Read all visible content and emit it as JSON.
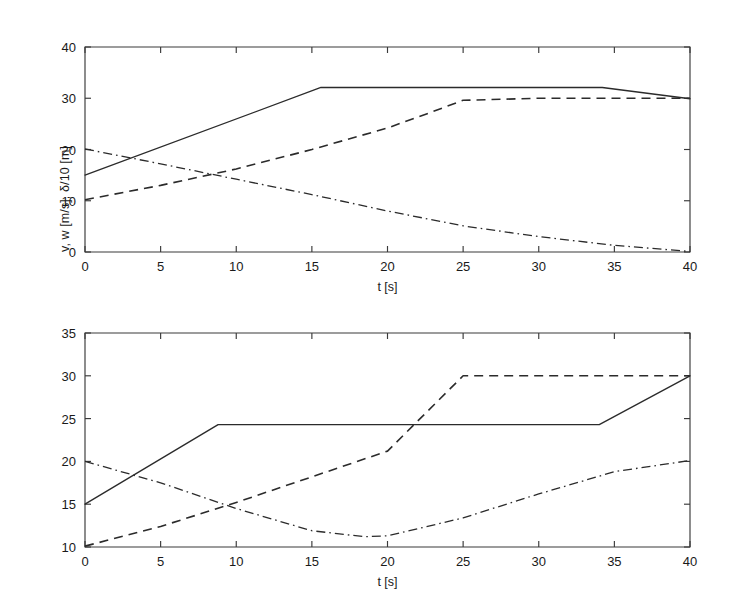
{
  "figure": {
    "background": "#ffffff",
    "ink_color": "#2b2b2b"
  },
  "chart_data": [
    {
      "id": "top",
      "type": "line",
      "title": "",
      "xlabel": "t [s]",
      "ylabel": "v, w [m/s], δ/10 [m]",
      "xlim": [
        0,
        40
      ],
      "ylim": [
        0,
        40
      ],
      "xticks": [
        0,
        5,
        10,
        15,
        20,
        25,
        30,
        35,
        40
      ],
      "xticklabels": [
        "0",
        "5",
        "10",
        "15",
        "20",
        "25",
        "30",
        "35",
        "40"
      ],
      "yticks": [
        0,
        10,
        20,
        30,
        40
      ],
      "yticklabels": [
        "0",
        "10",
        "20",
        "30",
        "40"
      ],
      "grid": false,
      "legend": "none",
      "series": [
        {
          "name": "v",
          "style": "solid",
          "x": [
            0,
            15.6,
            34.2,
            40
          ],
          "values": [
            15.0,
            32.1,
            32.1,
            29.9
          ]
        },
        {
          "name": "w",
          "style": "dashed",
          "x": [
            0,
            5,
            10,
            15,
            20,
            23,
            25,
            30,
            35,
            40
          ],
          "values": [
            10.2,
            13.0,
            16.2,
            20.0,
            24.2,
            27.4,
            29.6,
            30.0,
            30.0,
            30.0
          ]
        },
        {
          "name": "delta/10",
          "style": "dashdot",
          "x": [
            0,
            5,
            10,
            15,
            20,
            25,
            30,
            35,
            40
          ],
          "values": [
            20.1,
            17.2,
            14.2,
            11.2,
            8.0,
            5.1,
            3.0,
            1.3,
            0.1
          ]
        }
      ]
    },
    {
      "id": "bottom",
      "type": "line",
      "title": "",
      "xlabel": "t [s]",
      "ylabel": "v, w [m/s], δ/10 [m]",
      "xlim": [
        0,
        40
      ],
      "ylim": [
        10,
        35
      ],
      "xticks": [
        0,
        5,
        10,
        15,
        20,
        25,
        30,
        35,
        40
      ],
      "xticklabels": [
        "0",
        "5",
        "10",
        "15",
        "20",
        "25",
        "30",
        "35",
        "40"
      ],
      "yticks": [
        10,
        15,
        20,
        25,
        30,
        35
      ],
      "yticklabels": [
        "10",
        "15",
        "20",
        "25",
        "30",
        "35"
      ],
      "grid": false,
      "legend": "none",
      "series": [
        {
          "name": "v",
          "style": "solid",
          "x": [
            0,
            8.8,
            34.0,
            40
          ],
          "values": [
            15.0,
            24.3,
            24.3,
            30.0
          ]
        },
        {
          "name": "w",
          "style": "dashed",
          "x": [
            0,
            5,
            10,
            15,
            20,
            25,
            30,
            35,
            40
          ],
          "values": [
            10.1,
            12.4,
            15.2,
            18.2,
            21.2,
            30.0,
            30.0,
            30.0,
            30.0
          ]
        },
        {
          "name": "delta/10",
          "style": "dashdot",
          "x": [
            0,
            5,
            10,
            15,
            18.5,
            20,
            25,
            30,
            35,
            40
          ],
          "values": [
            20.0,
            17.5,
            14.5,
            11.9,
            11.2,
            11.3,
            13.4,
            16.2,
            18.8,
            20.1
          ]
        }
      ]
    }
  ]
}
